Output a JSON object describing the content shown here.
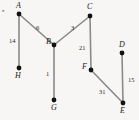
{
  "figure": {
    "background_color": "#f7f6f4",
    "edge_color": "#8a8a8a",
    "node_color": "#111111",
    "label_color": "#1a1a1a",
    "bullet_marker": "▪"
  },
  "nodes": [
    {
      "id": "A",
      "label": "A",
      "x": 19,
      "y": 14,
      "label_x": 16,
      "label_y": 2
    },
    {
      "id": "B",
      "label": "B",
      "x": 54,
      "y": 45,
      "label_x": 46,
      "label_y": 38
    },
    {
      "id": "C",
      "label": "C",
      "x": 90,
      "y": 16,
      "label_x": 87,
      "label_y": 3
    },
    {
      "id": "D",
      "label": "D",
      "x": 122,
      "y": 53,
      "label_x": 119,
      "label_y": 41
    },
    {
      "id": "E",
      "label": "E",
      "x": 123,
      "y": 103,
      "label_x": 120,
      "label_y": 107
    },
    {
      "id": "F",
      "label": "F",
      "x": 91,
      "y": 70,
      "label_x": 82,
      "label_y": 63
    },
    {
      "id": "G",
      "label": "G",
      "x": 54,
      "y": 100,
      "label_x": 51,
      "label_y": 104
    },
    {
      "id": "H",
      "label": "H",
      "x": 19,
      "y": 68,
      "label_x": 15,
      "label_y": 72
    }
  ],
  "edges": [
    {
      "from": "A",
      "to": "H",
      "weight": "14",
      "label_x": 9,
      "label_y": 37
    },
    {
      "from": "A",
      "to": "B",
      "weight": "6",
      "label_x": 36,
      "label_y": 24
    },
    {
      "from": "B",
      "to": "C",
      "weight": "3",
      "label_x": 71,
      "label_y": 24
    },
    {
      "from": "C",
      "to": "F",
      "weight": "21",
      "label_x": 79,
      "label_y": 44
    },
    {
      "from": "B",
      "to": "G",
      "weight": "1",
      "label_x": 46,
      "label_y": 70
    },
    {
      "from": "F",
      "to": "E",
      "weight": "31",
      "label_x": 99,
      "label_y": 88
    },
    {
      "from": "D",
      "to": "E",
      "weight": "15",
      "label_x": 128,
      "label_y": 76
    }
  ]
}
